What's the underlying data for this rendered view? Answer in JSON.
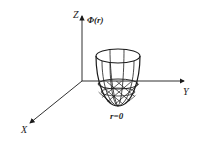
{
  "diagram": {
    "axes": {
      "z_label": "Z",
      "y_label": "Y",
      "x_label": "X"
    },
    "function_label": "Φ(r)",
    "origin_label": "r=0",
    "shape": "paraboloid-well",
    "colors": {
      "line": "#1a1a1a",
      "background": "#ffffff"
    }
  }
}
